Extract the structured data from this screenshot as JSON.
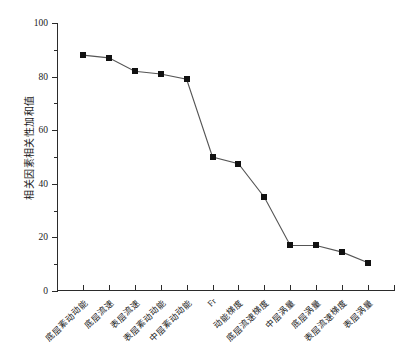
{
  "chart_data": {
    "type": "line",
    "title": "",
    "xlabel": "",
    "ylabel": "相关因素相关性加和值",
    "ylim": [
      0,
      100
    ],
    "yticks": [
      0,
      20,
      40,
      60,
      80,
      100
    ],
    "ytick_labels": [
      "0",
      "20",
      "40",
      "60",
      "80",
      "100"
    ],
    "minor_yticks": [
      10,
      30,
      50,
      70,
      90
    ],
    "grid": false,
    "legend": null,
    "marker": "filled-square",
    "line_color": "#555555",
    "marker_color": "#111111",
    "categories": [
      "底层紊动动能",
      "底层流速",
      "表层流速",
      "表层紊动动能",
      "中层紊动动能",
      "Fr",
      "动能梯度",
      "底层流速梯度",
      "中层涡量",
      "底层涡量",
      "表层流速梯度",
      "表层涡量"
    ],
    "values": [
      88,
      87,
      82,
      81,
      79,
      50,
      47.5,
      35,
      17,
      17,
      14.5,
      10.5
    ]
  }
}
